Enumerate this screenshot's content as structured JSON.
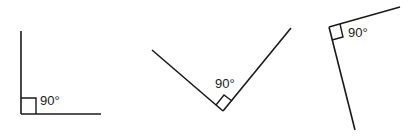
{
  "figures": [
    {
      "id": "angle-1",
      "label": "90°",
      "orientation": "arms right and up"
    },
    {
      "id": "angle-2",
      "label": "90°",
      "orientation": "V-shape opening upward"
    },
    {
      "id": "angle-3",
      "label": "90°",
      "orientation": "tilted, arms down and upper-right"
    }
  ]
}
